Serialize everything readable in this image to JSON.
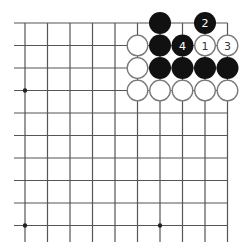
{
  "board": {
    "description": "Go board diagram, top-right corner region",
    "columns_visible": 10,
    "rows_visible": 10,
    "edges": {
      "top": true,
      "right": true,
      "left": false,
      "bottom": false
    },
    "star_points": [
      {
        "col": 1,
        "row": 4
      },
      {
        "col": 7,
        "row": 4
      },
      {
        "col": 1,
        "row": 10
      },
      {
        "col": 7,
        "row": 10
      }
    ],
    "colors": {
      "line": "#555555",
      "black_stone": "#111111",
      "white_stone": "#ffffff",
      "white_stroke": "#777777",
      "black_label": "#ffffff",
      "white_label": "#333333"
    }
  },
  "stones": [
    {
      "color": "black",
      "col": 7,
      "row": 1,
      "label": ""
    },
    {
      "color": "black",
      "col": 9,
      "row": 1,
      "label": "2"
    },
    {
      "color": "white",
      "col": 6,
      "row": 2,
      "label": ""
    },
    {
      "color": "black",
      "col": 7,
      "row": 2,
      "label": ""
    },
    {
      "color": "black",
      "col": 8,
      "row": 2,
      "label": "4"
    },
    {
      "color": "white",
      "col": 9,
      "row": 2,
      "label": "1"
    },
    {
      "color": "white",
      "col": 10,
      "row": 2,
      "label": "3"
    },
    {
      "color": "white",
      "col": 6,
      "row": 3,
      "label": ""
    },
    {
      "color": "black",
      "col": 7,
      "row": 3,
      "label": ""
    },
    {
      "color": "black",
      "col": 8,
      "row": 3,
      "label": ""
    },
    {
      "color": "black",
      "col": 9,
      "row": 3,
      "label": ""
    },
    {
      "color": "black",
      "col": 10,
      "row": 3,
      "label": ""
    },
    {
      "color": "white",
      "col": 6,
      "row": 4,
      "label": ""
    },
    {
      "color": "white",
      "col": 7,
      "row": 4,
      "label": ""
    },
    {
      "color": "white",
      "col": 8,
      "row": 4,
      "label": ""
    },
    {
      "color": "white",
      "col": 9,
      "row": 4,
      "label": ""
    },
    {
      "color": "white",
      "col": 10,
      "row": 4,
      "label": ""
    }
  ]
}
